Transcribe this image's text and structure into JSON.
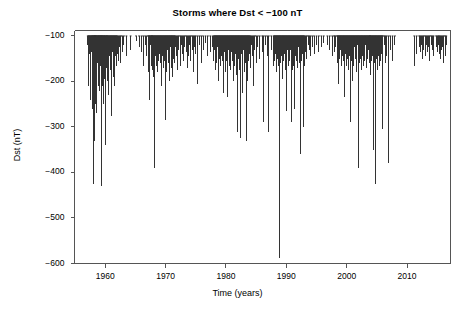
{
  "figure": {
    "background_color": "#ffffff",
    "axis_color": "#555555",
    "series_color": "#333333"
  },
  "chart_data": {
    "type": "line",
    "title": "Storms where Dst < −100 nT",
    "xlabel": "Time (years)",
    "ylabel": "Dst (nT)",
    "xlim": [
      1954.9,
      2017.2
    ],
    "ylim": [
      -600,
      -88
    ],
    "grid": false,
    "legend": null,
    "xticks": [
      1960,
      1970,
      1980,
      1990,
      2000,
      2010
    ],
    "xtick_labels": [
      "1960",
      "1970",
      "1980",
      "1990",
      "2000",
      "2010"
    ],
    "yticks": [
      -100,
      -200,
      -300,
      -400,
      -500,
      -600
    ],
    "ytick_labels": [
      "−100",
      "−200",
      "−300",
      "−400",
      "−500",
      "−600"
    ],
    "baseline": -100,
    "notes": [
      "Each vertical line is one storm: it extends downward from the -100 nT baseline to the storm minimum Dst.",
      "Deepest event near 1989.2 reaches about -589 nT (March 1989 superstorm).",
      "Sparse intervals near 1963-1965 and 2008-2011 correspond to solar minima."
    ],
    "x": [
      1957.1,
      1957.2,
      1957.3,
      1957.4,
      1957.5,
      1957.6,
      1957.7,
      1957.8,
      1957.85,
      1957.9,
      1958.0,
      1958.1,
      1958.15,
      1958.2,
      1958.25,
      1958.3,
      1958.35,
      1958.4,
      1958.5,
      1958.55,
      1958.6,
      1958.7,
      1958.8,
      1958.85,
      1958.9,
      1959.0,
      1959.1,
      1959.15,
      1959.2,
      1959.3,
      1959.35,
      1959.4,
      1959.5,
      1959.55,
      1959.6,
      1959.7,
      1959.8,
      1959.85,
      1959.9,
      1960.0,
      1960.1,
      1960.2,
      1960.25,
      1960.3,
      1960.4,
      1960.5,
      1960.6,
      1960.7,
      1960.8,
      1960.9,
      1961.0,
      1961.1,
      1961.2,
      1961.3,
      1961.4,
      1961.5,
      1961.6,
      1961.7,
      1961.8,
      1961.9,
      1962.0,
      1962.2,
      1962.4,
      1962.6,
      1962.8,
      1963.1,
      1963.5,
      1964.2,
      1965.1,
      1965.6,
      1966.0,
      1966.3,
      1966.6,
      1966.9,
      1967.1,
      1967.2,
      1967.3,
      1967.4,
      1967.5,
      1967.6,
      1967.7,
      1967.75,
      1967.8,
      1967.9,
      1968.0,
      1968.1,
      1968.2,
      1968.3,
      1968.4,
      1968.5,
      1968.6,
      1968.7,
      1968.8,
      1968.9,
      1969.0,
      1969.1,
      1969.2,
      1969.3,
      1969.4,
      1969.5,
      1969.6,
      1969.7,
      1969.8,
      1969.9,
      1970.0,
      1970.1,
      1970.2,
      1970.3,
      1970.4,
      1970.5,
      1970.6,
      1970.7,
      1970.8,
      1970.9,
      1971.0,
      1971.1,
      1971.2,
      1971.3,
      1971.4,
      1971.5,
      1971.6,
      1971.8,
      1972.0,
      1972.2,
      1972.4,
      1972.6,
      1972.8,
      1973.0,
      1973.2,
      1973.4,
      1973.6,
      1973.8,
      1974.0,
      1974.2,
      1974.4,
      1974.6,
      1974.8,
      1975.0,
      1975.3,
      1975.6,
      1975.9,
      1976.2,
      1976.6,
      1977.0,
      1977.4,
      1977.8,
      1978.0,
      1978.1,
      1978.2,
      1978.3,
      1978.4,
      1978.5,
      1978.6,
      1978.7,
      1978.8,
      1978.9,
      1979.0,
      1979.1,
      1979.2,
      1979.3,
      1979.4,
      1979.5,
      1979.6,
      1979.7,
      1979.8,
      1979.9,
      1980.0,
      1980.1,
      1980.2,
      1980.3,
      1980.4,
      1980.5,
      1980.6,
      1980.7,
      1980.8,
      1980.9,
      1981.0,
      1981.1,
      1981.2,
      1981.3,
      1981.4,
      1981.5,
      1981.6,
      1981.7,
      1981.8,
      1981.9,
      1982.0,
      1982.1,
      1982.2,
      1982.3,
      1982.4,
      1982.5,
      1982.6,
      1982.7,
      1982.8,
      1982.9,
      1983.0,
      1983.1,
      1983.2,
      1983.3,
      1983.4,
      1983.5,
      1983.6,
      1983.7,
      1983.8,
      1983.9,
      1984.0,
      1984.2,
      1984.4,
      1984.6,
      1984.8,
      1985.0,
      1985.3,
      1985.6,
      1986.0,
      1986.2,
      1986.5,
      1986.8,
      1987.1,
      1987.5,
      1987.9,
      1988.0,
      1988.1,
      1988.2,
      1988.3,
      1988.4,
      1988.5,
      1988.6,
      1988.7,
      1988.8,
      1988.9,
      1989.0,
      1989.1,
      1989.2,
      1989.3,
      1989.4,
      1989.5,
      1989.6,
      1989.7,
      1989.8,
      1989.9,
      1990.0,
      1990.1,
      1990.2,
      1990.3,
      1990.4,
      1990.5,
      1990.6,
      1990.7,
      1990.8,
      1990.9,
      1991.0,
      1991.1,
      1991.2,
      1991.3,
      1991.4,
      1991.5,
      1991.6,
      1991.7,
      1991.8,
      1991.9,
      1992.0,
      1992.1,
      1992.2,
      1992.3,
      1992.4,
      1992.5,
      1992.6,
      1992.7,
      1992.8,
      1992.9,
      1993.0,
      1993.2,
      1993.4,
      1993.6,
      1993.8,
      1994.0,
      1994.3,
      1994.6,
      1995.0,
      1995.4,
      1995.8,
      1996.2,
      1996.8,
      1997.2,
      1997.6,
      1997.9,
      1998.0,
      1998.2,
      1998.4,
      1998.5,
      1998.6,
      1998.7,
      1998.8,
      1998.9,
      1999.0,
      1999.1,
      1999.2,
      1999.3,
      1999.4,
      1999.5,
      1999.6,
      1999.7,
      1999.8,
      1999.9,
      2000.0,
      2000.1,
      2000.2,
      2000.3,
      2000.4,
      2000.5,
      2000.6,
      2000.7,
      2000.8,
      2000.9,
      2001.0,
      2001.1,
      2001.2,
      2001.3,
      2001.4,
      2001.5,
      2001.6,
      2001.7,
      2001.8,
      2001.9,
      2002.0,
      2002.1,
      2002.2,
      2002.3,
      2002.4,
      2002.5,
      2002.6,
      2002.7,
      2002.8,
      2002.9,
      2003.0,
      2003.1,
      2003.2,
      2003.3,
      2003.4,
      2003.5,
      2003.6,
      2003.7,
      2003.8,
      2003.85,
      2003.9,
      2004.0,
      2004.1,
      2004.2,
      2004.3,
      2004.4,
      2004.5,
      2004.6,
      2004.7,
      2004.8,
      2004.9,
      2005.0,
      2005.1,
      2005.2,
      2005.3,
      2005.4,
      2005.5,
      2005.6,
      2005.7,
      2005.8,
      2005.9,
      2006.0,
      2006.2,
      2006.4,
      2006.6,
      2006.9,
      2007.2,
      2007.6,
      2008.0,
      2011.2,
      2011.6,
      2012.0,
      2012.2,
      2012.4,
      2012.6,
      2012.8,
      2013.0,
      2013.2,
      2013.4,
      2013.6,
      2013.8,
      2014.0,
      2014.2,
      2014.4,
      2014.8,
      2015.0,
      2015.2,
      2015.3,
      2015.5,
      2015.7,
      2015.9,
      2016.1,
      2016.3,
      2016.5
    ],
    "y": [
      -120,
      -160,
      -210,
      -140,
      -185,
      -240,
      -135,
      -195,
      -150,
      -260,
      -175,
      -425,
      -145,
      -200,
      -330,
      -155,
      -115,
      -250,
      -190,
      -145,
      -270,
      -160,
      -210,
      -130,
      -180,
      -220,
      -135,
      -165,
      -145,
      -430,
      -190,
      -150,
      -210,
      -125,
      -175,
      -250,
      -145,
      -195,
      -160,
      -140,
      -340,
      -170,
      -120,
      -200,
      -150,
      -230,
      -185,
      -145,
      -165,
      -175,
      -155,
      -275,
      -135,
      -190,
      -150,
      -120,
      -210,
      -145,
      -165,
      -130,
      -140,
      -155,
      -125,
      -160,
      -135,
      -120,
      -145,
      -130,
      -110,
      -125,
      -135,
      -165,
      -120,
      -145,
      -180,
      -130,
      -240,
      -155,
      -120,
      -135,
      -165,
      -110,
      -145,
      -175,
      -190,
      -135,
      -390,
      -145,
      -120,
      -165,
      -130,
      -180,
      -155,
      -125,
      -140,
      -160,
      -130,
      -210,
      -145,
      -120,
      -170,
      -135,
      -155,
      -125,
      -285,
      -145,
      -180,
      -130,
      -160,
      -115,
      -200,
      -140,
      -125,
      -170,
      -135,
      -190,
      -120,
      -150,
      -135,
      -160,
      -125,
      -145,
      -175,
      -130,
      -165,
      -120,
      -140,
      -155,
      -125,
      -135,
      -170,
      -145,
      -120,
      -155,
      -130,
      -180,
      -125,
      -140,
      -205,
      -120,
      -160,
      -130,
      -115,
      -145,
      -135,
      -125,
      -155,
      -130,
      -175,
      -120,
      -140,
      -160,
      -125,
      -200,
      -135,
      -150,
      -120,
      -165,
      -130,
      -145,
      -155,
      -120,
      -225,
      -135,
      -125,
      -180,
      -140,
      -155,
      -120,
      -235,
      -130,
      -165,
      -125,
      -145,
      -175,
      -135,
      -120,
      -155,
      -200,
      -130,
      -165,
      -140,
      -125,
      -185,
      -130,
      -310,
      -150,
      -120,
      -175,
      -135,
      -325,
      -140,
      -120,
      -225,
      -155,
      -130,
      -180,
      -145,
      -160,
      -120,
      -330,
      -135,
      -200,
      -125,
      -155,
      -140,
      -170,
      -120,
      -145,
      -210,
      -130,
      -160,
      -125,
      -150,
      -135,
      -290,
      -120,
      -145,
      -310,
      -130,
      -165,
      -155,
      -125,
      -140,
      -180,
      -120,
      -150,
      -135,
      -165,
      -130,
      -589,
      -160,
      -120,
      -145,
      -195,
      -130,
      -155,
      -120,
      -140,
      -175,
      -125,
      -265,
      -150,
      -130,
      -165,
      -120,
      -145,
      -155,
      -130,
      -290,
      -140,
      -120,
      -175,
      -165,
      -130,
      -260,
      -145,
      -120,
      -155,
      -135,
      -170,
      -125,
      -160,
      -145,
      -360,
      -130,
      -155,
      -120,
      -140,
      -300,
      -125,
      -165,
      -135,
      -150,
      -120,
      -130,
      -145,
      -125,
      -140,
      -120,
      -135,
      -125,
      -115,
      -120,
      -130,
      -145,
      -120,
      -135,
      -125,
      -160,
      -140,
      -205,
      -125,
      -150,
      -130,
      -120,
      -165,
      -135,
      -145,
      -120,
      -155,
      -130,
      -235,
      -140,
      -120,
      -165,
      -150,
      -130,
      -175,
      -120,
      -145,
      -290,
      -135,
      -155,
      -120,
      -200,
      -140,
      -165,
      -125,
      -150,
      -130,
      -180,
      -145,
      -120,
      -390,
      -135,
      -160,
      -120,
      -150,
      -130,
      -175,
      -145,
      -120,
      -165,
      -135,
      -155,
      -120,
      -140,
      -170,
      -125,
      -150,
      -130,
      -160,
      -145,
      -120,
      -185,
      -135,
      -155,
      -120,
      -145,
      -350,
      -130,
      -160,
      -425,
      -125,
      -150,
      -135,
      -175,
      -120,
      -145,
      -165,
      -130,
      -155,
      -120,
      -140,
      -305,
      -135,
      -120,
      -160,
      -145,
      -380,
      -130,
      -155,
      -120,
      -165,
      -140,
      -125,
      -135,
      -120,
      -150,
      -130,
      -145,
      -120,
      -135,
      -125,
      -155,
      -120,
      -130,
      -145,
      -125,
      -135,
      -120,
      -140,
      -150,
      -130,
      -125,
      -160,
      -145,
      -120,
      -135,
      -230,
      -150,
      -125,
      -205,
      -140,
      -175,
      -130,
      -120
    ]
  }
}
